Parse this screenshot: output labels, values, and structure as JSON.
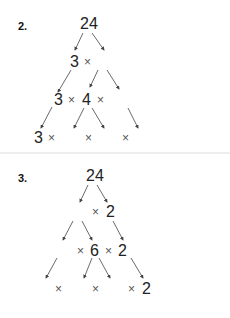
{
  "problems": [
    {
      "label": "2.",
      "root": "24",
      "row1": [
        "3",
        "×",
        "▦"
      ],
      "row2": [
        "3",
        "×",
        "4",
        "×",
        "▦"
      ],
      "row3": [
        "3",
        "×",
        "▦",
        "×",
        "▦",
        "×",
        "▦"
      ]
    },
    {
      "label": "3.",
      "root": "24",
      "row1": [
        "▦",
        "×",
        "2"
      ],
      "row2": [
        "▦",
        "×",
        "6",
        "×",
        "2"
      ],
      "row3": [
        "▦",
        "×",
        "▦",
        "×",
        "▦",
        "×",
        "2"
      ]
    }
  ],
  "symbols": {
    "times": "×",
    "blank": "placeholder-box"
  }
}
